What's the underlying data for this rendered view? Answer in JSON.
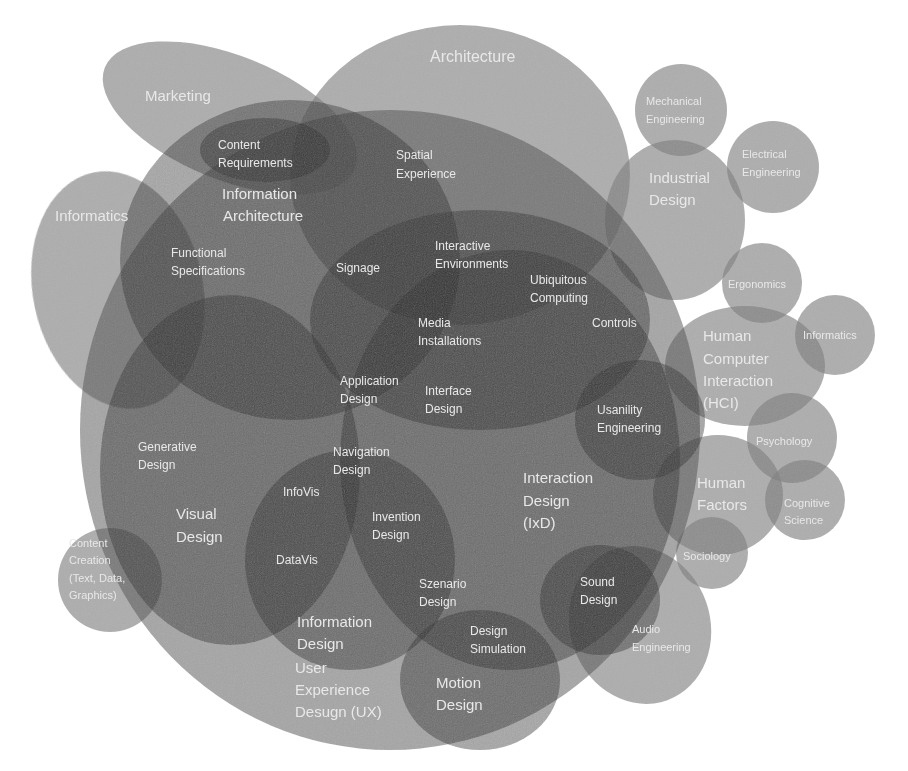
{
  "diagram": {
    "fill_color": "#6b6b6b",
    "text_color": "#e8e8e8",
    "background": "#ffffff"
  },
  "labels": {
    "architecture": "Architecture",
    "marketing": "Marketing",
    "mechanical_engineering": [
      "Mechanical",
      "Engineering"
    ],
    "electrical_engineering": [
      "Electrical",
      "Engineering"
    ],
    "content_requirements": [
      "Content",
      "Requirements"
    ],
    "spatial_experience": [
      "Spatial",
      "Experience"
    ],
    "industrial_design": [
      "Industrial",
      "Design"
    ],
    "informatics_left": "Informatics",
    "information_architecture": [
      "Information",
      "Architecture"
    ],
    "functional_specifications": [
      "Functional",
      "Specifications"
    ],
    "signage": "Signage",
    "interactive_environments": [
      "Interactive",
      "Environments"
    ],
    "ubiquitous_computing": [
      "Ubiquitous",
      "Computing"
    ],
    "ergonomics": "Ergonomics",
    "controls": "Controls",
    "media_installations": [
      "Media",
      "Installations"
    ],
    "hci": [
      "Human",
      "Computer",
      "Interaction",
      "(HCI)"
    ],
    "informatics_right": "Informatics",
    "application_design": [
      "Application",
      "Design"
    ],
    "interface_design": [
      "Interface",
      "Design"
    ],
    "usability_engineering": [
      "Usanility",
      "Engineering"
    ],
    "psychology": "Psychology",
    "generative_design": [
      "Generative",
      "Design"
    ],
    "navigation_design": [
      "Navigation",
      "Design"
    ],
    "infovis": "InfoVis",
    "interaction_design": [
      "Interaction",
      "Design",
      "(IxD)"
    ],
    "human_factors": [
      "Human",
      "Factors"
    ],
    "cognitive_science": [
      "Cognitive",
      "Science"
    ],
    "visual_design": [
      "Visual",
      "Design"
    ],
    "invention_design": [
      "Invention",
      "Design"
    ],
    "content_creation": [
      "Content",
      "Creation",
      "(Text, Data,",
      "Graphics)"
    ],
    "datavis": "DataVis",
    "sociology": "Sociology",
    "szenario_design": [
      "Szenario",
      "Design"
    ],
    "sound_design": [
      "Sound",
      "Design"
    ],
    "information_design": [
      "Information",
      "Design"
    ],
    "audio_engineering": [
      "Audio",
      "Engineering"
    ],
    "design_simulation": [
      "Design",
      "Simulation"
    ],
    "ux_design": [
      "User",
      "Experience",
      "Desugn (UX)"
    ],
    "motion_design": [
      "Motion",
      "Design"
    ]
  }
}
